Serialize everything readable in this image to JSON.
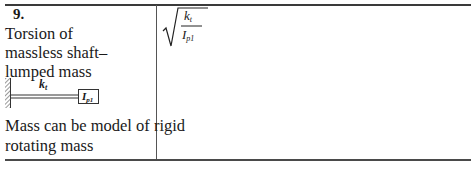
{
  "row": {
    "number": "9.",
    "title_lines": [
      "Torsion of",
      "massless shaft–",
      "lumped mass"
    ],
    "diagram": {
      "spring_label": "k",
      "spring_subscript": "t",
      "mass_label": "I",
      "mass_subscript": "p1"
    },
    "note_lines": [
      "Mass can be model of rigid",
      "rotating mass"
    ],
    "formula": {
      "numerator": "k",
      "numerator_subscript": "t",
      "denominator": "I",
      "denominator_subscript": "p1"
    }
  }
}
